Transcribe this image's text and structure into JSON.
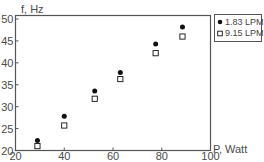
{
  "chart_data": {
    "type": "scatter",
    "title": "",
    "xlabel": "P, Watt",
    "ylabel": "f, Hz",
    "xlim": [
      20,
      100
    ],
    "ylim": [
      20,
      50
    ],
    "xticks": [
      20,
      40,
      60,
      80,
      100
    ],
    "yticks": [
      20,
      25,
      30,
      35,
      40,
      45,
      50
    ],
    "grid": false,
    "legend_position": "upper right, outside plot",
    "series": [
      {
        "name": "1.83 LPM",
        "marker": "filled-circle",
        "color": "#111111",
        "x": [
          29,
          40,
          52.5,
          63,
          77.5,
          88.5
        ],
        "y": [
          22.3,
          27.8,
          33.6,
          37.8,
          44.3,
          48.2
        ]
      },
      {
        "name": "9.15 LPM",
        "marker": "open-square",
        "color": "#111111",
        "x": [
          29,
          40,
          52.5,
          63,
          77.5,
          88.5
        ],
        "y": [
          21.0,
          25.7,
          31.8,
          36.3,
          42.2,
          46.0
        ]
      }
    ]
  },
  "labels": {
    "ylabel": "f, Hz",
    "xlabel": "P, Watt",
    "legend": [
      "1.83 LPM",
      "9.15 LPM"
    ]
  }
}
